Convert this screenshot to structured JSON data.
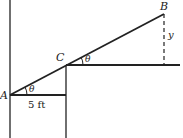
{
  "diagram": {
    "type": "geometry",
    "points": {
      "A": {
        "label": "A"
      },
      "B": {
        "label": "B"
      },
      "C": {
        "label": "C"
      }
    },
    "angle_labels": [
      "θ",
      "θ"
    ],
    "dimension_label": "5 ft",
    "height_label": "y",
    "colors": {
      "stroke": "#222222",
      "background": "#ffffff"
    }
  }
}
